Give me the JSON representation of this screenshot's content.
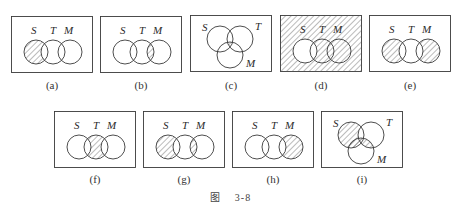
{
  "figure": {
    "caption_prefix": "图",
    "caption_number": "3-8"
  },
  "set_labels": {
    "s": "S",
    "t": "T",
    "m": "M"
  },
  "colors": {
    "stroke": "#3a3a3a",
    "hatch": "#555555",
    "background": "#ffffff"
  },
  "panels": [
    {
      "id": "a",
      "label": "(a)",
      "layout": "linear",
      "shaded": "S − T"
    },
    {
      "id": "b",
      "label": "(b)",
      "layout": "linear",
      "shaded": "T ∩ M"
    },
    {
      "id": "c",
      "label": "(c)",
      "layout": "triangular",
      "shaded": "S ∩ T ∩ M"
    },
    {
      "id": "d",
      "label": "(d)",
      "layout": "linear",
      "shaded": "complement of S"
    },
    {
      "id": "e",
      "label": "(e)",
      "layout": "linear",
      "shaded": "(S − T) ∪ (M − T)"
    },
    {
      "id": "f",
      "label": "(f)",
      "layout": "linear",
      "shaded": "T − (S ∪ M)"
    },
    {
      "id": "g",
      "label": "(g)",
      "layout": "linear",
      "shaded": "(S − T) ∪ (T ∩ M)"
    },
    {
      "id": "h",
      "label": "(h)",
      "layout": "linear",
      "shaded": "M − T"
    },
    {
      "id": "i",
      "label": "(i)",
      "layout": "triangular",
      "shaded": "(S − T) ∪ (M ∩ (S ∪ T))"
    }
  ]
}
